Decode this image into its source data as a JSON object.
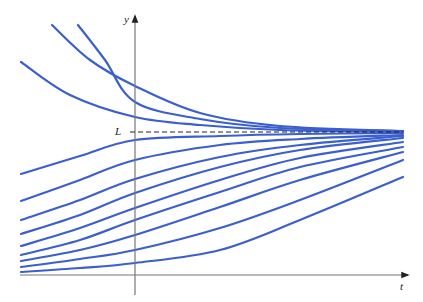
{
  "chart_data": {
    "type": "line",
    "title": "",
    "xlabel": "t",
    "ylabel": "y",
    "annotations": [
      {
        "label": "L",
        "type": "horizontal-dashed-line",
        "meaning": "limiting value / equilibrium"
      }
    ],
    "grid": false,
    "legend": null,
    "line_color": "#3b5fce",
    "axis_color": "#777777",
    "dashed_color": "#222222",
    "pixel_frame": {
      "x_axis_y": 275,
      "y_axis_x": 135,
      "L_y": 132,
      "x_start": 21,
      "x_end": 403
    },
    "series": [
      {
        "name": "above-1",
        "points": [
          [
            52,
            25
          ],
          [
            90,
            60
          ],
          [
            135,
            86
          ],
          [
            200,
            113
          ],
          [
            280,
            126
          ],
          [
            403,
            131
          ]
        ]
      },
      {
        "name": "above-2",
        "points": [
          [
            78,
            25
          ],
          [
            105,
            60
          ],
          [
            135,
            102
          ],
          [
            200,
            119
          ],
          [
            280,
            128
          ],
          [
            403,
            131
          ]
        ]
      },
      {
        "name": "above-3",
        "points": [
          [
            21,
            62
          ],
          [
            70,
            95
          ],
          [
            135,
            117
          ],
          [
            200,
            125
          ],
          [
            280,
            130
          ],
          [
            403,
            132
          ]
        ]
      },
      {
        "name": "below-1",
        "points": [
          [
            21,
            174
          ],
          [
            80,
            156
          ],
          [
            135,
            140
          ],
          [
            220,
            136
          ],
          [
            300,
            134
          ],
          [
            403,
            133
          ]
        ]
      },
      {
        "name": "below-2",
        "points": [
          [
            21,
            201
          ],
          [
            80,
            180
          ],
          [
            135,
            160
          ],
          [
            220,
            145
          ],
          [
            300,
            139
          ],
          [
            403,
            135
          ]
        ]
      },
      {
        "name": "below-3",
        "points": [
          [
            21,
            220
          ],
          [
            80,
            200
          ],
          [
            135,
            179
          ],
          [
            220,
            157
          ],
          [
            300,
            145
          ],
          [
            403,
            136
          ]
        ]
      },
      {
        "name": "below-4",
        "points": [
          [
            21,
            234
          ],
          [
            80,
            215
          ],
          [
            135,
            193
          ],
          [
            220,
            167
          ],
          [
            300,
            150
          ],
          [
            403,
            138
          ]
        ]
      },
      {
        "name": "below-5",
        "points": [
          [
            21,
            246
          ],
          [
            80,
            228
          ],
          [
            135,
            208
          ],
          [
            220,
            180
          ],
          [
            300,
            158
          ],
          [
            403,
            142
          ]
        ]
      },
      {
        "name": "below-6",
        "points": [
          [
            21,
            255
          ],
          [
            80,
            240
          ],
          [
            135,
            220
          ],
          [
            220,
            192
          ],
          [
            300,
            167
          ],
          [
            403,
            147
          ]
        ]
      },
      {
        "name": "below-7",
        "points": [
          [
            21,
            261
          ],
          [
            80,
            250
          ],
          [
            135,
            235
          ],
          [
            220,
            207
          ],
          [
            300,
            180
          ],
          [
            403,
            152
          ]
        ]
      },
      {
        "name": "below-8",
        "points": [
          [
            21,
            267
          ],
          [
            80,
            259
          ],
          [
            135,
            250
          ],
          [
            220,
            228
          ],
          [
            300,
            200
          ],
          [
            403,
            160
          ]
        ]
      },
      {
        "name": "below-9",
        "points": [
          [
            21,
            272
          ],
          [
            80,
            268
          ],
          [
            135,
            263
          ],
          [
            220,
            250
          ],
          [
            300,
            220
          ],
          [
            403,
            177
          ]
        ]
      }
    ]
  },
  "labels": {
    "y_axis": "y",
    "t_axis": "t",
    "L": "L"
  }
}
